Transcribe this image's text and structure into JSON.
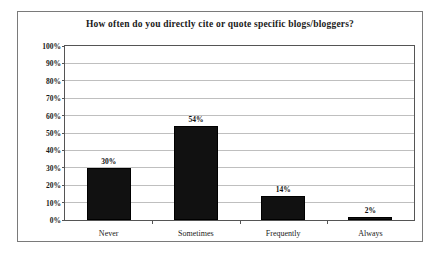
{
  "chart_data": {
    "type": "bar",
    "title": "How often do you directly cite or quote specific blogs/bloggers?",
    "categories": [
      "Never",
      "Sometimes",
      "Frequently",
      "Always"
    ],
    "values": [
      30,
      54,
      14,
      2
    ],
    "data_labels": [
      "30%",
      "54%",
      "14%",
      "2%"
    ],
    "xlabel": "",
    "ylabel": "",
    "ylim": [
      0,
      100
    ],
    "ytick_labels": [
      "0%",
      "10%",
      "20%",
      "30%",
      "40%",
      "50%",
      "60%",
      "70%",
      "80%",
      "90%",
      "100%"
    ],
    "ytick_values": [
      0,
      10,
      20,
      30,
      40,
      50,
      60,
      70,
      80,
      90,
      100
    ],
    "grid": "horizontal",
    "legend": "none",
    "bar_color": "#111111",
    "grid_color": "#bfbfbf",
    "axis_color": "#555555",
    "border_color": "#7a7a7a",
    "background_color": "#ffffff"
  }
}
